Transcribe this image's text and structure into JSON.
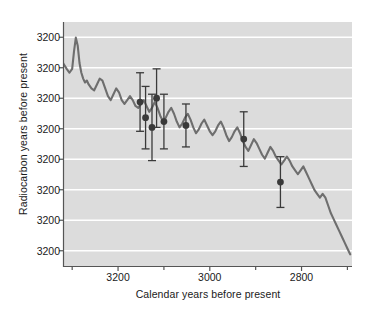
{
  "chart_data": {
    "type": "line",
    "title": "",
    "xlabel": "Calendar years before present",
    "ylabel": "Radiocarbon years before present",
    "xlim": [
      3320,
      2690
    ],
    "ylim": [
      2870,
      3120
    ],
    "x_inverted": true,
    "y_inverted": true,
    "grid": "horizontal-white",
    "legend": "none",
    "xticks": [
      3200,
      3000,
      2800
    ],
    "xtick_labels": [
      "3200",
      "3000",
      "2800"
    ],
    "xticks_minor": [
      3300,
      3100,
      2900,
      2700
    ],
    "yticks": [
      3200,
      3200,
      3200,
      3200,
      3200,
      3200,
      3200,
      3200
    ],
    "ytick_labels": [
      "3200",
      "3200",
      "3200",
      "3200",
      "3200",
      "3200",
      "3200",
      "3200"
    ],
    "series": [
      {
        "name": "calibration curve",
        "type": "line",
        "color": "#6e6e6e",
        "x": [
          3320,
          3312,
          3306,
          3300,
          3296,
          3292,
          3288,
          3284,
          3280,
          3276,
          3272,
          3268,
          3264,
          3258,
          3252,
          3246,
          3240,
          3234,
          3228,
          3222,
          3216,
          3210,
          3204,
          3198,
          3192,
          3186,
          3180,
          3174,
          3168,
          3162,
          3156,
          3150,
          3144,
          3138,
          3132,
          3126,
          3120,
          3114,
          3108,
          3102,
          3096,
          3090,
          3084,
          3078,
          3072,
          3066,
          3060,
          3054,
          3048,
          3042,
          3036,
          3030,
          3024,
          3018,
          3012,
          3006,
          3000,
          2994,
          2988,
          2982,
          2976,
          2970,
          2964,
          2958,
          2952,
          2946,
          2940,
          2934,
          2928,
          2922,
          2916,
          2910,
          2904,
          2898,
          2892,
          2886,
          2880,
          2874,
          2868,
          2862,
          2856,
          2850,
          2844,
          2838,
          2832,
          2826,
          2820,
          2814,
          2808,
          2802,
          2796,
          2790,
          2784,
          2778,
          2772,
          2766,
          2760,
          2754,
          2748,
          2742,
          2736,
          2730,
          2724,
          2718,
          2712,
          2706,
          2700,
          2694
        ],
        "y": [
          2912,
          2918,
          2922,
          2918,
          2900,
          2886,
          2894,
          2912,
          2922,
          2928,
          2932,
          2930,
          2934,
          2938,
          2940,
          2934,
          2928,
          2930,
          2938,
          2946,
          2950,
          2944,
          2938,
          2942,
          2950,
          2954,
          2950,
          2946,
          2950,
          2956,
          2958,
          2954,
          2950,
          2956,
          2962,
          2958,
          2952,
          2958,
          2966,
          2972,
          2968,
          2962,
          2958,
          2964,
          2972,
          2978,
          2974,
          2968,
          2964,
          2970,
          2978,
          2984,
          2980,
          2974,
          2970,
          2976,
          2982,
          2986,
          2982,
          2976,
          2972,
          2978,
          2986,
          2992,
          2988,
          2982,
          2978,
          2984,
          2992,
          2998,
          3002,
          2996,
          2990,
          2994,
          3000,
          3006,
          3010,
          3004,
          2998,
          3002,
          3008,
          3012,
          3016,
          3012,
          3008,
          3012,
          3018,
          3022,
          3026,
          3022,
          3018,
          3024,
          3030,
          3036,
          3042,
          3046,
          3050,
          3046,
          3050,
          3058,
          3066,
          3072,
          3078,
          3084,
          3090,
          3096,
          3102,
          3108
        ]
      },
      {
        "name": "dated samples",
        "type": "scatter-errorbar",
        "color": "#3a3a3a",
        "points": [
          {
            "x": 3152,
            "y": 2952,
            "yerr": 30
          },
          {
            "x": 3140,
            "y": 2968,
            "yerr": 32
          },
          {
            "x": 3126,
            "y": 2978,
            "yerr": 34
          },
          {
            "x": 3116,
            "y": 2948,
            "yerr": 30
          },
          {
            "x": 3100,
            "y": 2972,
            "yerr": 28
          },
          {
            "x": 3052,
            "y": 2976,
            "yerr": 22
          },
          {
            "x": 2926,
            "y": 2990,
            "yerr": 28
          },
          {
            "x": 2846,
            "y": 3034,
            "yerr": 26
          }
        ]
      }
    ]
  },
  "axes": {
    "xlabel": "Calendar years before present",
    "ylabel": "Radiocarbon years before present"
  }
}
